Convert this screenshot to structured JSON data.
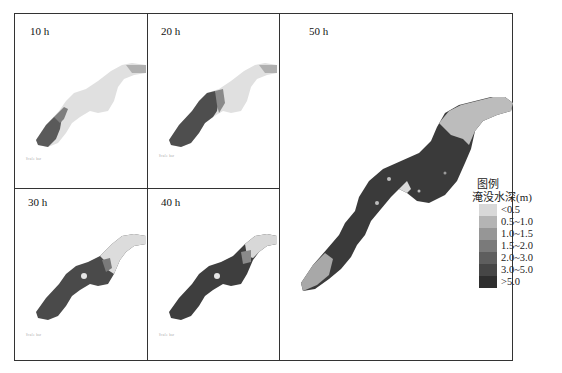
{
  "figure": {
    "panels": [
      {
        "id": "p10",
        "label": "10 h",
        "scale_text": "Scale bar"
      },
      {
        "id": "p20",
        "label": "20 h",
        "scale_text": "Scale bar"
      },
      {
        "id": "p30",
        "label": "30 h",
        "scale_text": "Scale bar"
      },
      {
        "id": "p40",
        "label": "40 h",
        "scale_text": "Scale bar"
      },
      {
        "id": "p50",
        "label": "50 h"
      }
    ],
    "legend": {
      "heading": "图例",
      "title": "淹没水深(m)",
      "items": [
        {
          "label": "<0.5",
          "color": "#d8d8d8"
        },
        {
          "label": "0.5~1.0",
          "color": "#b4b4b4"
        },
        {
          "label": "1.0~1.5",
          "color": "#969696"
        },
        {
          "label": "1.5~2.0",
          "color": "#7a7a7a"
        },
        {
          "label": "2.0~3.0",
          "color": "#5e5e5e"
        },
        {
          "label": "3.0~5.0",
          "color": "#464646"
        },
        {
          "label": ">5.0",
          "color": "#2e2e2e"
        }
      ]
    }
  }
}
